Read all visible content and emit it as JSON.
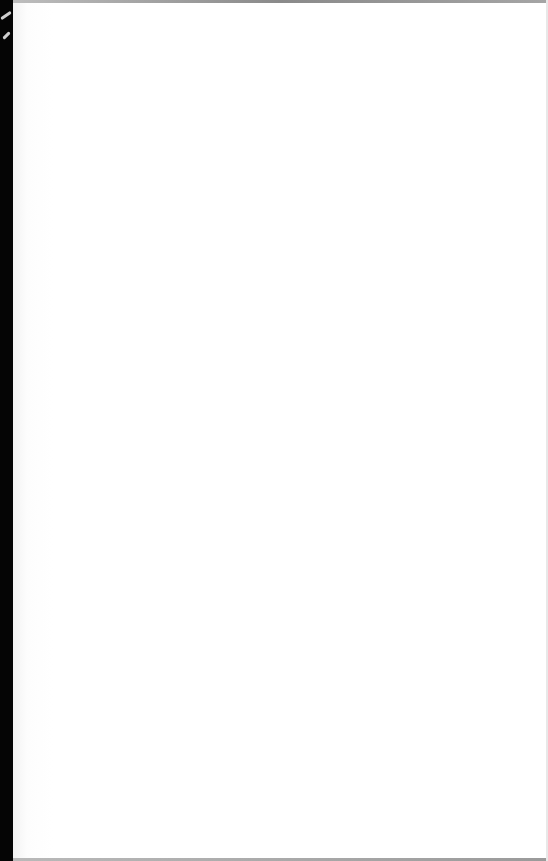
{
  "document": {
    "description": "Blank white page scan",
    "visible_text": [],
    "colors": {
      "page": "#ffffff",
      "edge": "#050505",
      "page_border_shadow": "#9a9a9a"
    }
  }
}
